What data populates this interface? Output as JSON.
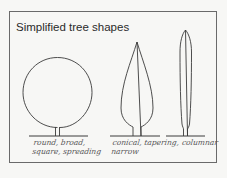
{
  "title": "Simplified tree shapes",
  "shapes": [
    {
      "name": "round",
      "caption_line1": "round, broad,",
      "caption_line2": "square, spreading"
    },
    {
      "name": "conical",
      "caption_line1": "conical, tapering,",
      "caption_line2": "narrow"
    },
    {
      "name": "columnar",
      "caption_line1": "columnar",
      "caption_line2": ""
    }
  ],
  "colors": {
    "line": "#3a3a3a",
    "background": "#f7f7f5",
    "frame": "#6a6a6a"
  }
}
